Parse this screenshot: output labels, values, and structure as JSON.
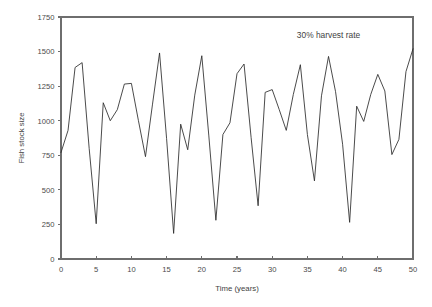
{
  "chart_data": {
    "type": "line",
    "title": "",
    "xlabel": "Time (years)",
    "ylabel": "Fish stock size",
    "xlim": [
      0,
      50
    ],
    "ylim": [
      0,
      1750
    ],
    "xticks": [
      0,
      5,
      10,
      15,
      20,
      25,
      30,
      35,
      40,
      45,
      50
    ],
    "yticks": [
      0,
      250,
      500,
      750,
      1000,
      1250,
      1500,
      1750
    ],
    "grid": false,
    "legend": null,
    "annotations": [
      {
        "text": "30% harvest rate",
        "x": 33.5,
        "y": 1595
      }
    ],
    "series": [
      {
        "name": "Fish stock size",
        "color": "#2b2b2b",
        "x": [
          0,
          1,
          2,
          3,
          4,
          5,
          6,
          7,
          8,
          9,
          10,
          11,
          12,
          13,
          14,
          15,
          16,
          17,
          18,
          19,
          20,
          21,
          22,
          23,
          24,
          25,
          26,
          27,
          28,
          29,
          30,
          31,
          32,
          33,
          34,
          35,
          36,
          37,
          38,
          39,
          40,
          41,
          42,
          43,
          44,
          45,
          46,
          47,
          48,
          49,
          50
        ],
        "values": [
          770,
          930,
          1385,
          1420,
          800,
          255,
          1130,
          1000,
          1080,
          1265,
          1270,
          1000,
          740,
          1120,
          1490,
          870,
          185,
          975,
          790,
          1185,
          1470,
          890,
          280,
          900,
          985,
          1340,
          1410,
          880,
          385,
          1205,
          1225,
          1080,
          930,
          1190,
          1405,
          900,
          565,
          1180,
          1465,
          1210,
          830,
          265,
          1105,
          995,
          1190,
          1335,
          1215,
          755,
          865,
          1355,
          1520
        ]
      }
    ]
  },
  "layout": {
    "plot_left": 61,
    "plot_right": 413,
    "plot_top": 17,
    "plot_bottom": 259
  }
}
